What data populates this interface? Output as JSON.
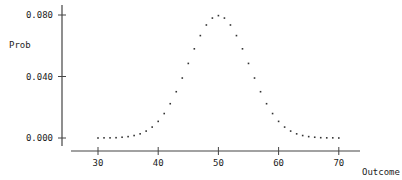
{
  "chart_data": {
    "type": "scatter",
    "title": "",
    "xlabel": "Outcome",
    "ylabel": "Prob",
    "xlim": [
      26,
      72
    ],
    "ylim": [
      0.0,
      0.08
    ],
    "grid": false,
    "legend": null,
    "x_ticks": [
      30,
      40,
      50,
      60,
      70
    ],
    "y_ticks": [
      "0.000",
      "0.040",
      "0.080"
    ],
    "y_tick_values": [
      0.0,
      0.04,
      0.08
    ],
    "series": [
      {
        "name": "Prob",
        "marker": "dot",
        "x": [
          30,
          31,
          32,
          33,
          34,
          35,
          36,
          37,
          38,
          39,
          40,
          41,
          42,
          43,
          44,
          45,
          46,
          47,
          48,
          49,
          50,
          51,
          52,
          53,
          54,
          55,
          56,
          57,
          58,
          59,
          60,
          61,
          62,
          63,
          64,
          65,
          66,
          67,
          68,
          69,
          70
        ],
        "values": [
          0.0,
          0.0001,
          0.0001,
          0.0002,
          0.0005,
          0.0009,
          0.0016,
          0.0027,
          0.0045,
          0.0071,
          0.0108,
          0.0159,
          0.0223,
          0.0301,
          0.039,
          0.0485,
          0.058,
          0.0666,
          0.0735,
          0.078,
          0.0796,
          0.078,
          0.0735,
          0.0666,
          0.058,
          0.0485,
          0.039,
          0.0301,
          0.0223,
          0.0159,
          0.0108,
          0.0071,
          0.0045,
          0.0027,
          0.0016,
          0.0009,
          0.0005,
          0.0002,
          0.0001,
          0.0001,
          0.0
        ]
      }
    ]
  },
  "colors": {
    "axis": "#444444",
    "points": "#333333",
    "text": "#222222"
  }
}
